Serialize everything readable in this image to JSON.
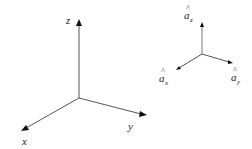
{
  "diagram": {
    "left_axes": {
      "labels": {
        "z": "z",
        "x": "x",
        "y": "y"
      }
    },
    "right_unit_vectors": {
      "labels": {
        "az_base": "a",
        "az_sub": "z",
        "ax_base": "a",
        "ax_sub": "x",
        "ay_base": "a",
        "ay_sub": "y",
        "hat": "^"
      }
    },
    "colors": {
      "line": "#555555",
      "arrow": "#111111",
      "text": "#222222",
      "background": "#ffffff"
    }
  }
}
